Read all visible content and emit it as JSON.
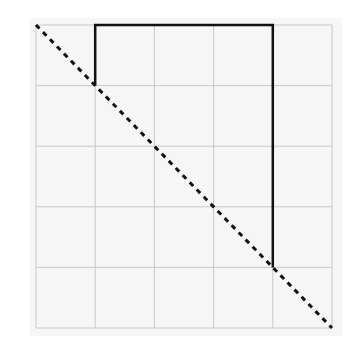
{
  "diagram": {
    "grid": {
      "rows": 5,
      "cols": 5,
      "origin_px": [
        36,
        25
      ],
      "cell_px": 59.2,
      "line_color": "#c8c8c8",
      "background": "#f6f6f6"
    },
    "dashed_diagonal": {
      "from_cell": [
        0,
        0
      ],
      "to_cell": [
        5,
        5
      ],
      "color": "#111111",
      "style": "dashed"
    },
    "solid_path": {
      "points_cell": [
        [
          1,
          1
        ],
        [
          1,
          0
        ],
        [
          4,
          0
        ],
        [
          4,
          4
        ]
      ],
      "color": "#111111",
      "style": "solid"
    }
  }
}
